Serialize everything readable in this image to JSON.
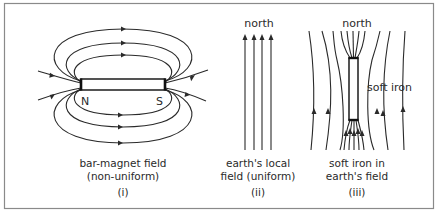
{
  "figure": {
    "panels": [
      {
        "id": "i",
        "caption_line1": "bar-magnet field",
        "caption_line2": "(non-uniform)",
        "numeral": "(i)",
        "poles": {
          "north": "N",
          "south": "S"
        }
      },
      {
        "id": "ii",
        "top_label": "north",
        "caption_line1": "earth's local",
        "caption_line2": "field (uniform)",
        "numeral": "(ii)"
      },
      {
        "id": "iii",
        "top_label": "north",
        "object_label": "soft iron",
        "caption_line1": "soft iron in",
        "caption_line2": "earth's field",
        "numeral": "(iii)"
      }
    ]
  }
}
